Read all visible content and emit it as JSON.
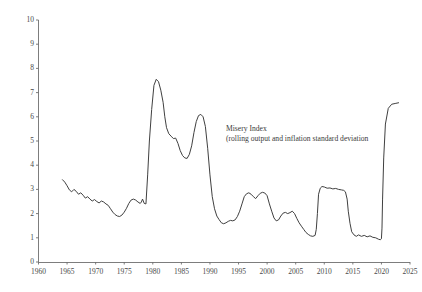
{
  "chart_data": {
    "type": "line",
    "title": "",
    "subtitle": "",
    "xlabel": "",
    "ylabel": "",
    "xlim": [
      1960,
      2025
    ],
    "ylim": [
      0,
      10
    ],
    "grid": false,
    "legend_position": "none",
    "annotations": [
      {
        "name": "series-annotation",
        "line1": "Misery Index",
        "line2": "(rolling output and inflation standard deviation",
        "x": 1996.5,
        "y": 4.65
      }
    ],
    "yticks": [
      0,
      1,
      2,
      3,
      4,
      5,
      6,
      7,
      8,
      9,
      10
    ],
    "ytick_labels": [
      "0",
      "1",
      "2",
      "3",
      "4",
      "5",
      "6",
      "7",
      "8",
      "9",
      "10"
    ],
    "xticks": [
      1960,
      1965,
      1970,
      1975,
      1980,
      1985,
      1990,
      1995,
      2000,
      2005,
      2010,
      2015,
      2020,
      2025
    ],
    "xtick_labels": [
      "1960",
      "1965",
      "1970",
      "1975",
      "1980",
      "1985",
      "1990",
      "1995",
      "2000",
      "2005",
      "2010",
      "2015",
      "2020",
      "2025"
    ],
    "series": [
      {
        "name": "Misery Index",
        "color": "#404040",
        "line_width": 1.0,
        "x": [
          1964.2,
          1964.6,
          1965.0,
          1965.4,
          1965.8,
          1966.2,
          1966.6,
          1967.0,
          1967.4,
          1967.8,
          1968.2,
          1968.6,
          1969.0,
          1969.4,
          1969.8,
          1970.2,
          1970.6,
          1971.0,
          1971.4,
          1971.8,
          1972.2,
          1972.6,
          1973.0,
          1973.4,
          1973.8,
          1974.2,
          1974.6,
          1975.0,
          1975.4,
          1975.8,
          1976.2,
          1976.6,
          1977.0,
          1977.4,
          1977.8,
          1978.0,
          1978.2,
          1978.5,
          1978.8,
          1979.1,
          1979.4,
          1979.8,
          1980.2,
          1980.6,
          1981.0,
          1981.4,
          1981.8,
          1982.1,
          1982.4,
          1982.8,
          1983.2,
          1983.6,
          1984.0,
          1984.4,
          1984.8,
          1985.2,
          1985.6,
          1986.0,
          1986.4,
          1986.8,
          1987.2,
          1987.6,
          1988.0,
          1988.4,
          1988.8,
          1989.2,
          1989.6,
          1990.0,
          1990.4,
          1990.8,
          1991.2,
          1991.6,
          1992.0,
          1992.4,
          1992.8,
          1993.2,
          1993.6,
          1994.0,
          1994.4,
          1994.8,
          1995.2,
          1995.6,
          1996.0,
          1996.4,
          1996.8,
          1997.2,
          1997.6,
          1998.0,
          1998.4,
          1998.8,
          1999.2,
          1999.6,
          2000.0,
          2000.4,
          2000.8,
          2001.2,
          2001.6,
          2002.0,
          2002.4,
          2002.8,
          2003.2,
          2003.6,
          2004.0,
          2004.4,
          2004.8,
          2005.2,
          2005.6,
          2006.0,
          2006.4,
          2006.8,
          2007.2,
          2007.6,
          2008.0,
          2008.4,
          2008.6,
          2008.8,
          2009.0,
          2009.3,
          2009.6,
          2010.0,
          2010.5,
          2011.0,
          2011.5,
          2012.0,
          2012.5,
          2013.0,
          2013.4,
          2013.7,
          2014.0,
          2014.2,
          2014.5,
          2014.8,
          2015.2,
          2015.6,
          2016.0,
          2016.5,
          2017.0,
          2017.5,
          2018.0,
          2018.5,
          2019.0,
          2019.5,
          2019.8,
          2020.0,
          2020.1,
          2020.2,
          2020.4,
          2020.7,
          2021.2,
          2021.8,
          2022.4,
          2023.0
        ],
        "y": [
          3.4,
          3.3,
          3.15,
          2.98,
          2.9,
          3.0,
          2.92,
          2.8,
          2.86,
          2.76,
          2.64,
          2.7,
          2.6,
          2.52,
          2.58,
          2.5,
          2.44,
          2.52,
          2.48,
          2.4,
          2.34,
          2.2,
          2.06,
          1.96,
          1.9,
          1.88,
          1.94,
          2.06,
          2.22,
          2.42,
          2.56,
          2.6,
          2.56,
          2.48,
          2.42,
          2.48,
          2.6,
          2.42,
          2.4,
          3.6,
          5.0,
          6.3,
          7.3,
          7.55,
          7.45,
          7.1,
          6.6,
          6.0,
          5.55,
          5.3,
          5.2,
          5.1,
          5.12,
          4.9,
          4.6,
          4.4,
          4.3,
          4.28,
          4.45,
          4.8,
          5.35,
          5.8,
          6.05,
          6.1,
          6.0,
          5.6,
          4.7,
          3.6,
          2.7,
          2.2,
          1.9,
          1.75,
          1.62,
          1.58,
          1.62,
          1.68,
          1.72,
          1.7,
          1.74,
          1.88,
          2.1,
          2.4,
          2.7,
          2.82,
          2.86,
          2.8,
          2.7,
          2.62,
          2.74,
          2.84,
          2.88,
          2.85,
          2.74,
          2.4,
          2.1,
          1.82,
          1.7,
          1.74,
          1.9,
          2.02,
          2.05,
          2.0,
          2.04,
          2.1,
          2.0,
          1.8,
          1.62,
          1.48,
          1.35,
          1.22,
          1.14,
          1.08,
          1.06,
          1.1,
          1.35,
          2.0,
          2.8,
          3.05,
          3.12,
          3.1,
          3.05,
          3.06,
          3.02,
          3.04,
          3.0,
          2.98,
          2.96,
          2.9,
          2.6,
          2.1,
          1.6,
          1.25,
          1.12,
          1.06,
          1.12,
          1.06,
          1.1,
          1.04,
          1.08,
          1.02,
          1.0,
          0.94,
          0.92,
          0.96,
          1.4,
          2.6,
          4.3,
          5.7,
          6.35,
          6.52,
          6.55,
          6.58
        ]
      }
    ]
  }
}
